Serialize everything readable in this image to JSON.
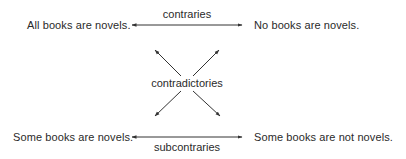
{
  "square_of_opposition": {
    "propositions": {
      "A": "All books are novels.",
      "E": "No books are novels.",
      "I": "Some books are novels.",
      "O": "Some books are not novels."
    },
    "relations": {
      "top": "contraries",
      "diagonal": "contradictories",
      "bottom": "subcontraries"
    },
    "colors": {
      "text": "#2a2a2a",
      "lines": "#333333",
      "background": "#ffffff"
    }
  }
}
